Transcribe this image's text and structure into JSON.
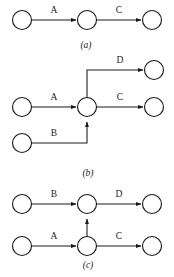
{
  "figure": {
    "background_color": "#ffffff",
    "ink_color": "#1a1a1a",
    "width": 174,
    "height": 277
  },
  "panels": [
    {
      "id": "panel-a",
      "caption": "(a)",
      "caption_x": 86,
      "caption_y": 48,
      "nodes": [
        {
          "name": "a-node-left",
          "cx": 22,
          "cy": 20,
          "r": 9.5
        },
        {
          "name": "a-node-middle",
          "cx": 87,
          "cy": 20,
          "r": 9.5
        },
        {
          "name": "a-node-right",
          "cx": 152,
          "cy": 20,
          "r": 9.5
        }
      ],
      "edges": [
        {
          "name": "a-edge-A",
          "label": "A",
          "label_x": 54,
          "label_y": 13,
          "x1": 31.5,
          "y1": 20,
          "x2": 77.5,
          "y2": 20
        },
        {
          "name": "a-edge-C",
          "label": "C",
          "label_x": 119,
          "label_y": 13,
          "x1": 96.5,
          "y1": 20,
          "x2": 142.5,
          "y2": 20
        }
      ]
    },
    {
      "id": "panel-b",
      "caption": "(b)",
      "caption_x": 88,
      "caption_y": 176,
      "nodes": [
        {
          "name": "b-node-source-a",
          "cx": 22,
          "cy": 107,
          "r": 9.5
        },
        {
          "name": "b-node-source-b",
          "cx": 22,
          "cy": 143,
          "r": 9.5
        },
        {
          "name": "b-node-junction",
          "cx": 87,
          "cy": 107,
          "r": 9.5
        },
        {
          "name": "b-node-target-d",
          "cx": 154,
          "cy": 70,
          "r": 9.5
        },
        {
          "name": "b-node-target-c",
          "cx": 154,
          "cy": 107,
          "r": 9.5
        }
      ],
      "edges": [
        {
          "name": "b-edge-A",
          "label": "A",
          "label_x": 54,
          "label_y": 100
        },
        {
          "name": "b-edge-B",
          "label": "B",
          "label_x": 54,
          "label_y": 136
        },
        {
          "name": "b-edge-C",
          "label": "C",
          "label_x": 120,
          "label_y": 100
        },
        {
          "name": "b-edge-D",
          "label": "D",
          "label_x": 120,
          "label_y": 63
        }
      ]
    },
    {
      "id": "panel-c",
      "caption": "(c)",
      "caption_x": 88,
      "caption_y": 268,
      "nodes": [
        {
          "name": "c-node-source-b",
          "cx": 22,
          "cy": 204,
          "r": 9.5
        },
        {
          "name": "c-node-junction-top",
          "cx": 87,
          "cy": 204,
          "r": 9.5
        },
        {
          "name": "c-node-target-d",
          "cx": 152,
          "cy": 204,
          "r": 9.5
        },
        {
          "name": "c-node-source-a",
          "cx": 22,
          "cy": 246,
          "r": 9.5
        },
        {
          "name": "c-node-junction-bot",
          "cx": 87,
          "cy": 246,
          "r": 9.5
        },
        {
          "name": "c-node-target-c",
          "cx": 152,
          "cy": 246,
          "r": 9.5
        }
      ],
      "edges": [
        {
          "name": "c-edge-B",
          "label": "B",
          "label_x": 54,
          "label_y": 197
        },
        {
          "name": "c-edge-D",
          "label": "D",
          "label_x": 119,
          "label_y": 197
        },
        {
          "name": "c-edge-A",
          "label": "A",
          "label_x": 54,
          "label_y": 239
        },
        {
          "name": "c-edge-C",
          "label": "C",
          "label_x": 119,
          "label_y": 239
        }
      ]
    }
  ]
}
